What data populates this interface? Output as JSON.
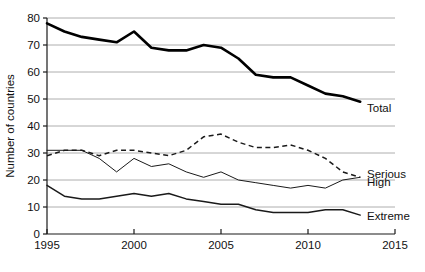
{
  "chart_data": {
    "type": "line",
    "title": "",
    "subtitle": "",
    "xlabel": "",
    "ylabel": "Number of countries",
    "xlim": [
      1995,
      2015
    ],
    "ylim": [
      0,
      80
    ],
    "ytick_step": 10,
    "yticks": [
      "0",
      "10",
      "20",
      "30",
      "40",
      "50",
      "60",
      "70",
      "80"
    ],
    "xticks": [
      "1995",
      "2000",
      "2005",
      "2010",
      "2015"
    ],
    "xtick_values": [
      1995,
      2000,
      2005,
      2010,
      2015
    ],
    "grid": "horizontal",
    "legend_position": "right-inline-labels",
    "x": [
      1995,
      1996,
      1997,
      1998,
      1999,
      2000,
      2001,
      2002,
      2003,
      2004,
      2005,
      2006,
      2007,
      2008,
      2009,
      2010,
      2011,
      2012,
      2013
    ],
    "series": [
      {
        "name": "Total",
        "style": "solid-thick",
        "color": "#000000",
        "values": [
          78,
          75,
          73,
          72,
          71,
          75,
          69,
          68,
          68,
          70,
          69,
          65,
          59,
          58,
          58,
          55,
          52,
          51,
          49
        ]
      },
      {
        "name": "Serious",
        "style": "dashed",
        "color": "#1a1a1a",
        "values": [
          29,
          31,
          31,
          29,
          31,
          31,
          30,
          29,
          31,
          36,
          37,
          34,
          32,
          32,
          33,
          31,
          28,
          23,
          21
        ]
      },
      {
        "name": "High",
        "style": "solid-thin",
        "color": "#1a1a1a",
        "values": [
          31,
          31,
          31,
          28,
          23,
          28,
          25,
          26,
          23,
          21,
          23,
          20,
          19,
          18,
          17,
          18,
          17,
          20,
          21
        ]
      },
      {
        "name": "Extreme",
        "style": "solid-medium",
        "color": "#1a1a1a",
        "values": [
          18,
          14,
          13,
          13,
          14,
          15,
          14,
          15,
          13,
          12,
          11,
          11,
          9,
          8,
          8,
          8,
          9,
          9,
          7
        ]
      }
    ],
    "series_labels": [
      {
        "name": "Total",
        "value_at_end": 49
      },
      {
        "name": "Serious",
        "value_at_end": 21
      },
      {
        "name": "High",
        "value_at_end": 21
      },
      {
        "name": "Extreme",
        "value_at_end": 7
      }
    ]
  }
}
